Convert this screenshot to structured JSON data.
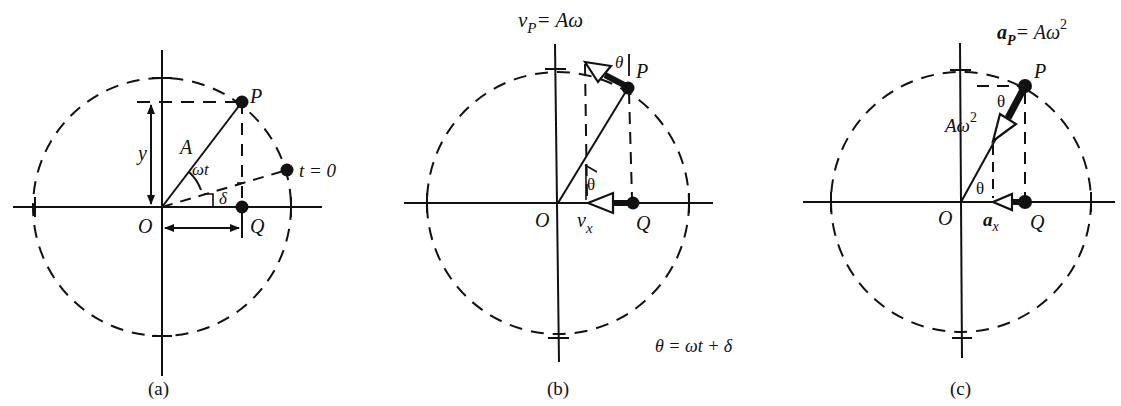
{
  "figure": {
    "panels": [
      {
        "id": "a",
        "caption": "(a)",
        "labels": {
          "point_P": "P",
          "point_Q": "Q",
          "origin": "O",
          "amplitude": "A",
          "angle_wt": "ωt",
          "phase": "δ",
          "displacement": "y",
          "t0_point": "t = 0"
        }
      },
      {
        "id": "b",
        "caption": "(b)",
        "labels": {
          "title_v": "v",
          "title_sub": "P",
          "title_rhs": "= Aω",
          "point_P": "P",
          "point_Q": "Q",
          "origin": "O",
          "theta_top": "θ",
          "theta_mid": "θ",
          "vx_v": "v",
          "vx_sub": "x",
          "theta_def": "θ = ωt + δ"
        }
      },
      {
        "id": "c",
        "caption": "(c)",
        "labels": {
          "title_a": "a",
          "title_sub": "P",
          "title_rhs": "= Aω",
          "title_sup": "2",
          "point_P": "P",
          "point_Q": "Q",
          "origin": "O",
          "theta_top": "θ",
          "theta_mid": "θ",
          "acc_label": "Aω",
          "acc_sup": "2",
          "ax_a": "a",
          "ax_sub": "x"
        }
      }
    ],
    "colors": {
      "ink": "#111111",
      "background": "#ffffff"
    }
  }
}
